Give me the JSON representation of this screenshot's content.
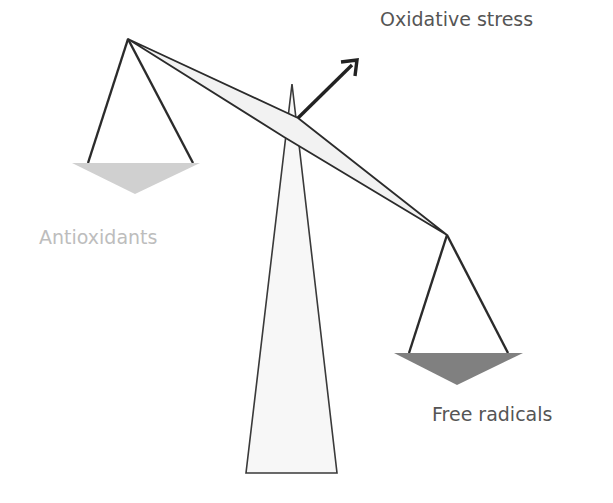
{
  "diagram": {
    "labels": {
      "oxidative_stress": "Oxidative stress",
      "antioxidants": "Antioxidants",
      "free_radicals": "Free radicals"
    },
    "colors": {
      "stroke": "#2b2b2b",
      "antioxidant_pan": "#d0d0d0",
      "free_radical_pan": "#808080",
      "fulcrum_fill": "#f7f7f7",
      "antioxidant_text": "#bdbdbd",
      "dark_text": "#555555"
    },
    "state": "tilted toward free radicals"
  }
}
